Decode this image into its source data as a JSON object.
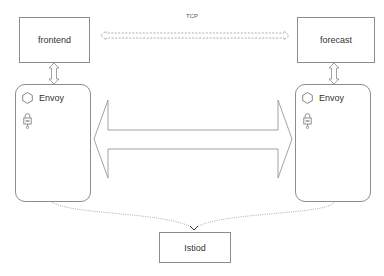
{
  "diagram": {
    "title": "",
    "services": {
      "frontend": {
        "label": "frontend"
      },
      "forecast": {
        "label": "forecast"
      },
      "istiod": {
        "label": "Istiod"
      }
    },
    "sidecars": {
      "left": {
        "label": "Envoy",
        "icons": [
          "hexagon-icon",
          "lock-icon"
        ]
      },
      "right": {
        "label": "Envoy",
        "icons": [
          "hexagon-icon",
          "lock-icon"
        ]
      }
    },
    "connections": {
      "tcp": {
        "label": "TCP",
        "style": "dashed-double-arrow",
        "from": "frontend",
        "to": "forecast"
      },
      "mesh": {
        "label": "",
        "style": "large-double-arrow",
        "from": "envoy-left",
        "to": "envoy-right"
      },
      "app_to_sidecar_left": {
        "style": "small-double-arrow",
        "from": "frontend",
        "to": "envoy-left"
      },
      "app_to_sidecar_right": {
        "style": "small-double-arrow",
        "from": "forecast",
        "to": "envoy-right"
      },
      "control_left": {
        "style": "dotted-curve",
        "from": "envoy-left",
        "to": "istiod"
      },
      "control_right": {
        "style": "dotted-curve",
        "from": "envoy-right",
        "to": "istiod"
      }
    },
    "colors": {
      "stroke": "#8c8c8c",
      "text": "#333333",
      "background": "#ffffff"
    }
  }
}
